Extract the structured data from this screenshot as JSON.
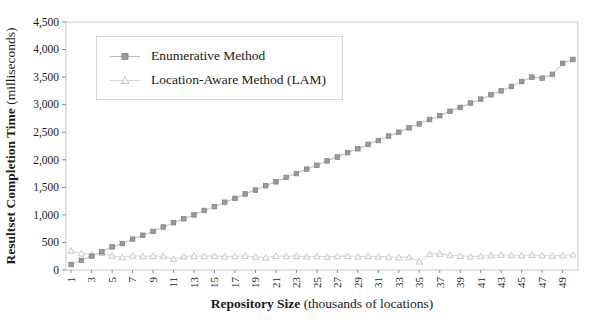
{
  "axes": {
    "y_title_bold": "Resultset Completion Time",
    "y_title_regular": " (milliseconds)",
    "x_title_bold": "Repository Size",
    "x_title_regular": " (thousands of locations)"
  },
  "legend": {
    "items": [
      {
        "label": "Enumerative Method",
        "marker": "square"
      },
      {
        "label": "Location-Aware Method (LAM)",
        "marker": "triangle"
      }
    ]
  },
  "colors": {
    "background": "#ffffff",
    "text": "#1a1a1a",
    "plot_border": "#c9c9c9",
    "tick": "#8c8c8c",
    "enum_line": "#b8b8b8",
    "enum_marker_fill": "#9a9a9a",
    "enum_marker_edge": "#7f7f7f",
    "lam_line": "#d4d4d4",
    "lam_marker_fill": "#f7f7f7",
    "lam_marker_edge": "#c0c0c0"
  },
  "chart_data": {
    "type": "line",
    "title": "",
    "xlabel": "Repository Size (thousands of locations)",
    "ylabel": "Resultset Completion Time (milliseconds)",
    "ylim": [
      0,
      4500
    ],
    "grid": false,
    "legend_position": "upper-left-inside",
    "x": [
      1,
      2,
      3,
      4,
      5,
      6,
      7,
      8,
      9,
      10,
      11,
      12,
      13,
      14,
      15,
      16,
      17,
      18,
      19,
      20,
      21,
      22,
      23,
      24,
      25,
      26,
      27,
      28,
      29,
      30,
      31,
      32,
      33,
      34,
      35,
      36,
      37,
      38,
      39,
      40,
      41,
      42,
      43,
      44,
      45,
      46,
      47,
      48,
      49,
      50
    ],
    "x_tick_labels": [
      "1",
      "3",
      "5",
      "7",
      "9",
      "11",
      "13",
      "15",
      "17",
      "19",
      "21",
      "23",
      "25",
      "27",
      "29",
      "31",
      "33",
      "35",
      "37",
      "39",
      "41",
      "43",
      "45",
      "47",
      "49"
    ],
    "y_ticks": [
      0,
      500,
      1000,
      1500,
      2000,
      2500,
      3000,
      3500,
      4000,
      4500
    ],
    "y_tick_labels": [
      "0",
      "500",
      "1,000",
      "1,500",
      "2,000",
      "2,500",
      "3,000",
      "3,500",
      "4,000",
      "4,500"
    ],
    "series": [
      {
        "name": "Enumerative Method",
        "marker": "square",
        "values": [
          100,
          175,
          250,
          330,
          420,
          480,
          560,
          630,
          700,
          780,
          860,
          930,
          1000,
          1080,
          1150,
          1230,
          1300,
          1380,
          1450,
          1530,
          1600,
          1680,
          1750,
          1830,
          1900,
          1980,
          2050,
          2130,
          2200,
          2280,
          2350,
          2430,
          2500,
          2580,
          2650,
          2730,
          2800,
          2880,
          2950,
          3030,
          3100,
          3180,
          3250,
          3330,
          3420,
          3500,
          3480,
          3550,
          3750,
          3820
        ]
      },
      {
        "name": "Location-Aware Method (LAM)",
        "marker": "triangle",
        "values": [
          350,
          300,
          280,
          310,
          260,
          230,
          260,
          250,
          255,
          250,
          200,
          245,
          255,
          250,
          255,
          245,
          250,
          255,
          240,
          225,
          255,
          250,
          255,
          245,
          250,
          240,
          250,
          255,
          245,
          250,
          245,
          235,
          230,
          235,
          155,
          290,
          295,
          270,
          255,
          245,
          250,
          265,
          275,
          270,
          265,
          275,
          265,
          255,
          265,
          280
        ]
      }
    ]
  }
}
